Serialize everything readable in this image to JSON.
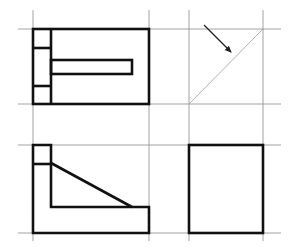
{
  "diagram": {
    "title": "",
    "type": "orthographic-projection-views",
    "views": [
      {
        "name": "top-view",
        "position": "top-left"
      },
      {
        "name": "miter-line-construction",
        "position": "top-right"
      },
      {
        "name": "front-view",
        "position": "bottom-left"
      },
      {
        "name": "side-view",
        "position": "bottom-right"
      }
    ],
    "colors": {
      "outline": "#111111",
      "grid": "#8a8a8a",
      "miter_line": "#9a9a9a",
      "background": "#ffffff"
    },
    "grid": {
      "vertical_x": [
        33,
        149,
        189,
        263
      ],
      "horizontal_y": [
        29,
        104,
        145,
        233
      ]
    },
    "annotations": [
      {
        "type": "arrow",
        "from": [
          204,
          25
        ],
        "to": [
          232,
          53
        ]
      }
    ]
  }
}
